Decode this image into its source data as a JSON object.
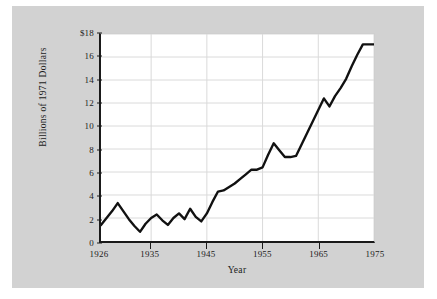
{
  "figure": {
    "background_color": "#d2d2d2",
    "plot_background_color": "#ffffff",
    "grid_color": "#d9d9d9",
    "axis_color": "#1a1a1a",
    "line_color": "#111111"
  },
  "axes": {
    "y_title": "Billions of 1971 Dollars",
    "x_title": "Year",
    "y_tick_labels": [
      "$18",
      "16",
      "14",
      "12",
      "10",
      "8",
      "6",
      "4",
      "2",
      "0"
    ],
    "y_tick_values": [
      18,
      16,
      14,
      12,
      10,
      8,
      6,
      4,
      2,
      0
    ],
    "x_tick_labels": [
      "1926",
      "1935",
      "1945",
      "1955",
      "1965",
      "1975"
    ],
    "x_tick_values": [
      1926,
      1935,
      1945,
      1955,
      1965,
      1975
    ]
  },
  "chart_data": {
    "type": "line",
    "title": "",
    "xlabel": "Year",
    "ylabel": "Billions of 1971 Dollars",
    "xlim": [
      1926,
      1975
    ],
    "ylim": [
      0,
      18
    ],
    "grid": true,
    "legend": "none",
    "x": [
      1926,
      1927,
      1928,
      1929,
      1930,
      1931,
      1932,
      1933,
      1934,
      1935,
      1936,
      1937,
      1938,
      1939,
      1940,
      1941,
      1942,
      1943,
      1944,
      1945,
      1946,
      1947,
      1948,
      1949,
      1950,
      1951,
      1952,
      1953,
      1954,
      1955,
      1956,
      1957,
      1958,
      1959,
      1960,
      1961,
      1962,
      1963,
      1964,
      1965,
      1966,
      1967,
      1968,
      1969,
      1970,
      1971,
      1972,
      1973,
      1974,
      1975
    ],
    "series": [
      {
        "name": "Billions of 1971 Dollars",
        "values": [
          1.4,
          2.0,
          2.6,
          3.3,
          2.6,
          1.9,
          1.3,
          0.8,
          1.5,
          2.0,
          2.3,
          1.8,
          1.4,
          2.0,
          2.4,
          1.9,
          2.8,
          2.1,
          1.7,
          2.4,
          3.4,
          4.3,
          4.4,
          4.7,
          5.0,
          5.4,
          5.8,
          6.2,
          6.2,
          6.4,
          7.5,
          8.5,
          7.9,
          7.3,
          7.3,
          7.4,
          8.4,
          9.4,
          10.4,
          11.4,
          12.4,
          11.7,
          12.6,
          13.3,
          14.1,
          15.2,
          16.2,
          17.1,
          17.1,
          17.1
        ]
      }
    ]
  }
}
